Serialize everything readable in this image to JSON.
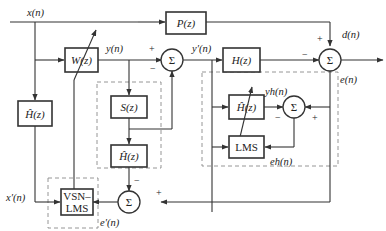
{
  "diagram": {
    "title": "",
    "blocks": {
      "P": "P(z)",
      "W": "W(z)",
      "H": "H(z)",
      "S": "S(z)",
      "Hhat_left": "Ĥ(z)",
      "Hhat_mid": "Ĥ(z)",
      "Hhat_right": "Ĥ(z)",
      "LMS": "LMS",
      "VSNLMS_line1": "VSN–",
      "VSNLMS_line2": "LMS"
    },
    "sum_symbol": "Σ",
    "signals": {
      "x": "x(n)",
      "y": "y(n)",
      "yprime": "y′(n)",
      "d": "d(n)",
      "e": "e(n)",
      "xprime": "x′(n)",
      "eprime": "e′(n)",
      "yh": "yh(n)",
      "eh": "eh(n)"
    },
    "signs": {
      "plus": "+",
      "minus": "−"
    }
  }
}
